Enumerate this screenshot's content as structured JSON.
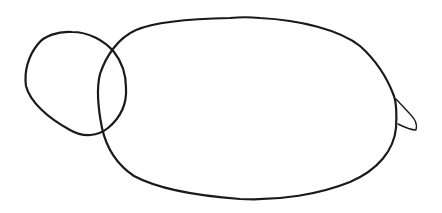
{
  "drawing": {
    "description": "Simple line sketch: small circle overlapping a large oval with a small pointed tail",
    "stroke_color": "#1a1a1a",
    "background": "#ffffff",
    "shapes": [
      {
        "name": "head-circle"
      },
      {
        "name": "body-oval"
      },
      {
        "name": "tail"
      }
    ]
  }
}
